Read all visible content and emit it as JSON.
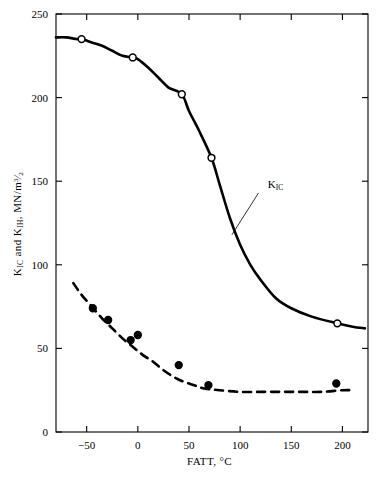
{
  "chart_data": {
    "type": "line",
    "title": "",
    "subtitle": "",
    "xlabel": "FATT, °C",
    "ylabel": "KᴵC and KᴵH, MN/m³ᐟ²",
    "xlabel_parts": {
      "name": "FATT",
      "sep": ", ",
      "unit": "°C"
    },
    "ylabel_parts": {
      "k1": "K",
      "k1_sub": "IC",
      "conj": " and ",
      "k2": "K",
      "k2_sub": "IH",
      "sep": ", ",
      "unit": "MN/m",
      "unit_exp_num": "3",
      "unit_exp_slash": "⁄",
      "unit_exp_den": "2"
    },
    "xlim": [
      -80,
      225
    ],
    "ylim": [
      0,
      250
    ],
    "xticks": [
      -50,
      0,
      50,
      100,
      150,
      200
    ],
    "xtick_labels": [
      "−50",
      "0",
      "50",
      "100",
      "150",
      "200"
    ],
    "yticks": [
      0,
      50,
      100,
      150,
      200,
      250
    ],
    "ytick_labels": [
      "0",
      "50",
      "100",
      "150",
      "200",
      "250"
    ],
    "grid": false,
    "legend_position": "inline-annotation",
    "axis_box": "full-rectangle",
    "series": [
      {
        "name": "K_IC",
        "label": "K",
        "label_sub": "IC",
        "label_x": 128,
        "label_y": 147,
        "leader_from": [
          118,
          143
        ],
        "leader_to": [
          92,
          118
        ],
        "linestyle": "solid",
        "linewidth": 2.6,
        "color": "#000000",
        "marker": "open-circle",
        "curve": [
          [
            -80,
            236
          ],
          [
            -70,
            236
          ],
          [
            -60,
            235
          ],
          [
            -55,
            235
          ],
          [
            -45,
            233
          ],
          [
            -35,
            231
          ],
          [
            -25,
            228
          ],
          [
            -15,
            225
          ],
          [
            -5,
            224
          ],
          [
            0,
            223
          ],
          [
            10,
            218
          ],
          [
            20,
            212
          ],
          [
            30,
            206
          ],
          [
            43,
            202
          ],
          [
            50,
            192
          ],
          [
            60,
            180
          ],
          [
            72,
            164
          ],
          [
            80,
            148
          ],
          [
            90,
            128
          ],
          [
            100,
            112
          ],
          [
            110,
            100
          ],
          [
            120,
            91
          ],
          [
            135,
            80
          ],
          [
            150,
            74
          ],
          [
            170,
            69
          ],
          [
            195,
            65
          ],
          [
            210,
            63
          ],
          [
            222,
            62
          ]
        ],
        "points": [
          [
            -55,
            235
          ],
          [
            -5,
            224
          ],
          [
            43,
            202
          ],
          [
            72,
            164
          ],
          [
            195,
            65
          ]
        ]
      },
      {
        "name": "K_IH",
        "label": "K",
        "label_sub": "IH",
        "label_x": 96,
        "label_y": 313,
        "leader_from": [
          92,
          322
        ],
        "leader_to": [
          66,
          348
        ],
        "linestyle": "dashed",
        "linewidth": 2.6,
        "color": "#000000",
        "marker": "filled-circle",
        "curve": [
          [
            -63,
            89
          ],
          [
            -55,
            82
          ],
          [
            -45,
            75
          ],
          [
            -35,
            68
          ],
          [
            -25,
            62
          ],
          [
            -15,
            56
          ],
          [
            -5,
            51
          ],
          [
            5,
            46
          ],
          [
            15,
            42
          ],
          [
            25,
            37
          ],
          [
            35,
            33
          ],
          [
            45,
            30
          ],
          [
            55,
            28
          ],
          [
            65,
            26
          ],
          [
            80,
            25
          ],
          [
            100,
            24
          ],
          [
            120,
            24
          ],
          [
            140,
            24
          ],
          [
            160,
            24
          ],
          [
            180,
            24
          ],
          [
            200,
            25
          ],
          [
            210,
            25
          ]
        ],
        "points": [
          [
            -44,
            74
          ],
          [
            -29,
            67
          ],
          [
            -7,
            55
          ],
          [
            0,
            58
          ],
          [
            40,
            40
          ],
          [
            69,
            28
          ],
          [
            194,
            29
          ]
        ]
      }
    ]
  },
  "figure": {
    "background_color": "#ffffff",
    "line_color": "#000000",
    "marker_open_fill": "#ffffff"
  }
}
